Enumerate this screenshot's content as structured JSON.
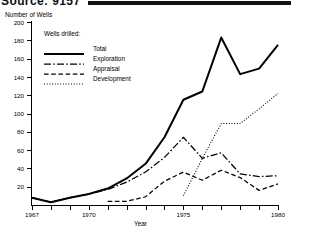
{
  "header": {
    "title": "Source: 9157",
    "rule_color": "#111111"
  },
  "axis": {
    "ylabel": "Number of Wells",
    "xlabel": "Year",
    "yticks": [
      0,
      20,
      40,
      60,
      80,
      100,
      120,
      140,
      160,
      180,
      200
    ],
    "ytick_labels": [
      "",
      "20",
      "40",
      "60",
      "80",
      "100",
      "120",
      "140",
      "160",
      "180",
      "200"
    ],
    "xticks": [
      1967,
      1968,
      1969,
      1970,
      1971,
      1972,
      1973,
      1974,
      1975,
      1976,
      1977,
      1978,
      1979,
      1980
    ],
    "xtick_labels": [
      "1967",
      "",
      "",
      "1970",
      "",
      "",
      "",
      "",
      "1975",
      "",
      "",
      "",
      "",
      "1980"
    ]
  },
  "legend": {
    "title": "Wells drilled:",
    "items": [
      {
        "label": "Total",
        "style": "solid",
        "color": "#000000"
      },
      {
        "label": "Exploration",
        "style": "dashdot",
        "color": "#000000"
      },
      {
        "label": "Appraisal",
        "style": "dashed",
        "color": "#000000"
      },
      {
        "label": "Development",
        "style": "dotted",
        "color": "#000000"
      }
    ]
  },
  "chart_data": {
    "type": "line",
    "title": "",
    "xlabel": "Year",
    "ylabel": "Number of Wells",
    "xlim": [
      1967,
      1980
    ],
    "ylim": [
      0,
      200
    ],
    "grid": false,
    "legend_position": "upper-left-inside",
    "x": [
      1967,
      1968,
      1969,
      1970,
      1971,
      1972,
      1973,
      1974,
      1975,
      1976,
      1977,
      1978,
      1979,
      1980
    ],
    "series": [
      {
        "name": "Total",
        "style": "solid",
        "x": [
          1967,
          1968,
          1969,
          1970,
          1971,
          1972,
          1973,
          1974,
          1975,
          1976,
          1977,
          1978,
          1979,
          1980
        ],
        "values": [
          8,
          3,
          8,
          12,
          18,
          29,
          45,
          74,
          115,
          124,
          183,
          143,
          149,
          175
        ]
      },
      {
        "name": "Exploration",
        "style": "dashdot",
        "x": [
          1967,
          1968,
          1969,
          1970,
          1971,
          1972,
          1973,
          1974,
          1975,
          1976,
          1977,
          1978,
          1979,
          1980
        ],
        "values": [
          8,
          3,
          8,
          12,
          17,
          25,
          36,
          52,
          74,
          51,
          57,
          34,
          31,
          32
        ]
      },
      {
        "name": "Appraisal",
        "style": "dashed",
        "x": [
          1971,
          1972,
          1973,
          1974,
          1975,
          1976,
          1977,
          1978,
          1979,
          1980
        ],
        "values": [
          4,
          4,
          9,
          26,
          36,
          27,
          38,
          30,
          16,
          23
        ]
      },
      {
        "name": "Development",
        "style": "dotted",
        "x": [
          1975,
          1976,
          1977,
          1978,
          1979,
          1980
        ],
        "values": [
          10,
          51,
          89,
          89,
          105,
          122
        ]
      }
    ]
  }
}
